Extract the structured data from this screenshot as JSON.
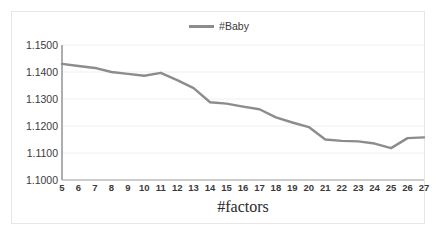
{
  "chart_data": {
    "type": "line",
    "title": "",
    "xlabel": "#factors",
    "ylabel": "",
    "legend": [
      "#Baby"
    ],
    "legend_position": "top-center",
    "grid": true,
    "grid_axis": "y",
    "line_color": "#8c8c8c",
    "background": "#ffffff",
    "xlim": [
      5,
      27
    ],
    "ylim": [
      1.1,
      1.15
    ],
    "yticks": [
      "1.1000",
      "1.1100",
      "1.1200",
      "1.1300",
      "1.1400",
      "1.1500"
    ],
    "ytick_values": [
      1.1,
      1.11,
      1.12,
      1.13,
      1.14,
      1.15
    ],
    "xticks": [
      "5",
      "6",
      "7",
      "8",
      "9",
      "10",
      "11",
      "12",
      "13",
      "14",
      "15",
      "16",
      "17",
      "18",
      "19",
      "20",
      "21",
      "22",
      "23",
      "24",
      "25",
      "26",
      "27"
    ],
    "x": [
      5,
      6,
      7,
      8,
      9,
      10,
      11,
      12,
      13,
      14,
      15,
      16,
      17,
      18,
      19,
      20,
      21,
      22,
      23,
      24,
      25,
      26,
      27
    ],
    "series": [
      {
        "name": "#Baby",
        "color": "#8c8c8c",
        "values": [
          1.143,
          1.1422,
          1.1415,
          1.14,
          1.1393,
          1.1386,
          1.1397,
          1.137,
          1.134,
          1.1288,
          1.1283,
          1.1272,
          1.1262,
          1.1232,
          1.1213,
          1.1196,
          1.115,
          1.1145,
          1.1143,
          1.1135,
          1.1118,
          1.1155,
          1.1158
        ]
      }
    ]
  },
  "legend": {
    "label": "#Baby"
  },
  "axis": {
    "x_title": "#factors"
  }
}
